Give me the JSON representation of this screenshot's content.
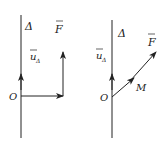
{
  "figures": [
    {
      "axis_label": "Δ",
      "unit_vector_label": "u",
      "unit_vector_sub": "Δ",
      "force_label": "F",
      "origin_label": "O"
    },
    {
      "axis_label": "Δ",
      "unit_vector_label": "u",
      "unit_vector_sub": "Δ",
      "force_label": "F",
      "origin_label": "O",
      "point_label": "M"
    }
  ],
  "colors": {
    "stroke": "#222222",
    "background": "#ffffff"
  }
}
